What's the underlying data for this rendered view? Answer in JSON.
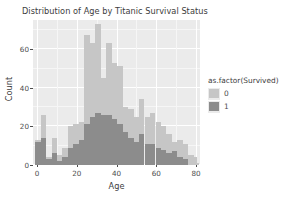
{
  "chart_data": {
    "type": "bar",
    "title": "Distribution of Age by Titanic Survival Status",
    "xlabel": "Age",
    "ylabel": "Count",
    "xlim": [
      -2,
      82
    ],
    "ylim": [
      0,
      75
    ],
    "xticks": [
      0,
      20,
      40,
      60,
      80
    ],
    "yticks": [
      0,
      20,
      40,
      60
    ],
    "grid": true,
    "stacked": true,
    "bin_width": 2.75,
    "legend": {
      "title": "as.factor(Survived)",
      "position": "right",
      "entries": [
        {
          "label": "0",
          "color": "#c6c6c6"
        },
        {
          "label": "1",
          "color": "#8c8c8c"
        }
      ]
    },
    "series": [
      {
        "name": "0",
        "color": "#c6c6c6",
        "values": [
          13,
          26,
          4,
          14,
          5,
          9,
          20,
          21,
          22,
          67,
          63,
          73,
          45,
          63,
          53,
          51,
          30,
          29,
          25,
          34,
          25,
          27,
          22,
          20,
          16,
          12,
          13,
          11,
          5,
          4,
          1
        ]
      },
      {
        "name": "1",
        "color": "#8c8c8c",
        "values": [
          12,
          14,
          3,
          6,
          2,
          4,
          9,
          11,
          13,
          21,
          25,
          27,
          26,
          26,
          24,
          21,
          17,
          14,
          12,
          16,
          11,
          11,
          9,
          8,
          6,
          7,
          4,
          3,
          0,
          0,
          0
        ]
      }
    ],
    "bin_centers": [
      0.5,
      3.2,
      6,
      8.7,
      11.5,
      14.2,
      17,
      19.7,
      22.5,
      25.2,
      28,
      30.7,
      33.5,
      36.2,
      39,
      41.7,
      44.5,
      47.2,
      50,
      52.7,
      55.5,
      58.2,
      61,
      63.7,
      66.5,
      69.2,
      72,
      74.7,
      77.5,
      79,
      80
    ],
    "bins": [
      {
        "x": 0.5,
        "total": 13,
        "survived_0": 13,
        "survived_1": 12
      },
      {
        "x": 3.2,
        "total": 26,
        "survived_0": 26,
        "survived_1": 14
      },
      {
        "x": 6.0,
        "total": 4,
        "survived_0": 4,
        "survived_1": 3
      },
      {
        "x": 8.7,
        "total": 14,
        "survived_0": 14,
        "survived_1": 6
      },
      {
        "x": 11.5,
        "total": 5,
        "survived_0": 5,
        "survived_1": 2
      },
      {
        "x": 14.2,
        "total": 9,
        "survived_0": 9,
        "survived_1": 4
      },
      {
        "x": 17.0,
        "total": 20,
        "survived_0": 20,
        "survived_1": 9
      },
      {
        "x": 19.7,
        "total": 21,
        "survived_0": 21,
        "survived_1": 11
      },
      {
        "x": 22.5,
        "total": 22,
        "survived_0": 22,
        "survived_1": 13
      },
      {
        "x": 25.2,
        "total": 67,
        "survived_0": 67,
        "survived_1": 21
      },
      {
        "x": 28.0,
        "total": 63,
        "survived_0": 63,
        "survived_1": 25
      },
      {
        "x": 30.7,
        "total": 73,
        "survived_0": 73,
        "survived_1": 27
      },
      {
        "x": 33.5,
        "total": 45,
        "survived_0": 45,
        "survived_1": 26
      },
      {
        "x": 36.2,
        "total": 63,
        "survived_0": 63,
        "survived_1": 26
      },
      {
        "x": 39.0,
        "total": 53,
        "survived_0": 53,
        "survived_1": 24
      },
      {
        "x": 41.7,
        "total": 51,
        "survived_0": 51,
        "survived_1": 21
      },
      {
        "x": 44.5,
        "total": 30,
        "survived_0": 30,
        "survived_1": 17
      },
      {
        "x": 47.2,
        "total": 29,
        "survived_0": 29,
        "survived_1": 14
      },
      {
        "x": 50.0,
        "total": 25,
        "survived_0": 25,
        "survived_1": 12
      },
      {
        "x": 52.7,
        "total": 34,
        "survived_0": 34,
        "survived_1": 16
      },
      {
        "x": 55.5,
        "total": 25,
        "survived_0": 25,
        "survived_1": 11
      },
      {
        "x": 58.2,
        "total": 27,
        "survived_0": 27,
        "survived_1": 11
      },
      {
        "x": 61.0,
        "total": 22,
        "survived_0": 22,
        "survived_1": 9
      },
      {
        "x": 63.7,
        "total": 20,
        "survived_0": 20,
        "survived_1": 8
      },
      {
        "x": 66.5,
        "total": 16,
        "survived_0": 16,
        "survived_1": 6
      },
      {
        "x": 69.2,
        "total": 12,
        "survived_0": 12,
        "survived_1": 7
      },
      {
        "x": 72.0,
        "total": 13,
        "survived_0": 13,
        "survived_1": 4
      },
      {
        "x": 74.7,
        "total": 11,
        "survived_0": 11,
        "survived_1": 3
      },
      {
        "x": 77.5,
        "total": 5,
        "survived_0": 5,
        "survived_1": 0
      },
      {
        "x": 79.0,
        "total": 4,
        "survived_0": 4,
        "survived_1": 0
      },
      {
        "x": 80.0,
        "total": 1,
        "survived_0": 1,
        "survived_1": 0
      }
    ]
  },
  "theme": {
    "panel_background": "#ebebeb",
    "grid_color": "#ffffff",
    "text_color": "#4d4d4d",
    "page_background": "#ffffff"
  }
}
